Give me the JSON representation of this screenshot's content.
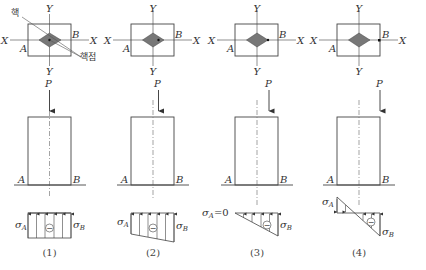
{
  "figure": {
    "annotations": {
      "core": "핵",
      "core_point": "핵점"
    },
    "axis_labels": {
      "x": "X",
      "y": "Y"
    },
    "point_labels": {
      "a": "A",
      "b": "B"
    },
    "load_label": "P",
    "stress_labels": {
      "sigma_a": "σ",
      "sigma_b": "σ",
      "sub_a": "A",
      "sub_b": "B",
      "zero": "=0"
    },
    "sign_symbol": "−",
    "panels": [
      {
        "caption": "(1)",
        "load_position": "center (centroid)",
        "stress": "uniform compression"
      },
      {
        "caption": "(2)",
        "load_position": "within core",
        "stress": "trapezoidal compression"
      },
      {
        "caption": "(3)",
        "load_position": "core boundary (core point)",
        "stress": "triangular, σA = 0"
      },
      {
        "caption": "(4)",
        "load_position": "outside core",
        "stress": "tension at A, compression at B"
      }
    ]
  }
}
